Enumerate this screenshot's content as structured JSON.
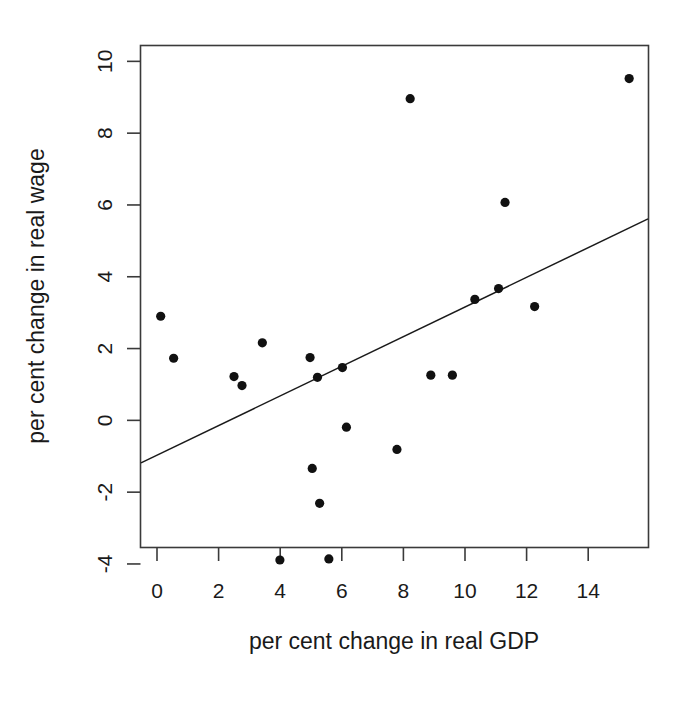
{
  "chart_data": {
    "type": "scatter",
    "title": "",
    "xlabel": "per cent change in real GDP",
    "ylabel": "per cent change in real wage",
    "xlim": [
      -0.75,
      16.3
    ],
    "ylim": [
      -4.6,
      10.4
    ],
    "xticks": [
      0,
      2,
      4,
      6,
      8,
      10,
      12,
      14
    ],
    "xtick_labels": [
      "0",
      "2",
      "4",
      "6",
      "8",
      "10",
      "12",
      "14"
    ],
    "yticks": [
      -4,
      -2,
      0,
      2,
      4,
      6,
      8,
      10
    ],
    "ytick_labels": [
      "-4",
      "-2",
      "0",
      "2",
      "4",
      "6",
      "8",
      "10"
    ],
    "grid": false,
    "legend": false,
    "legend_position": "none",
    "marker": "filled-circle",
    "marker_color": "#111111",
    "frame_color": "#3a3a3a",
    "x": [
      0.12,
      0.54,
      2.5,
      2.76,
      3.42,
      3.99,
      4.97,
      5.04,
      5.21,
      5.28,
      5.58,
      6.02,
      6.15,
      7.79,
      8.22,
      8.89,
      9.59,
      10.32,
      11.09,
      11.3,
      12.26,
      15.33
    ],
    "y": [
      2.9,
      1.73,
      1.22,
      0.97,
      2.16,
      -3.89,
      1.75,
      -1.34,
      1.2,
      -2.31,
      -3.86,
      1.47,
      -0.19,
      -0.81,
      8.96,
      1.26,
      1.26,
      3.37,
      3.67,
      6.07,
      3.17,
      9.52
    ],
    "points": [
      {
        "x": 0.12,
        "y": 2.9
      },
      {
        "x": 0.54,
        "y": 1.73
      },
      {
        "x": 2.5,
        "y": 1.22
      },
      {
        "x": 2.76,
        "y": 0.97
      },
      {
        "x": 3.42,
        "y": 2.16
      },
      {
        "x": 3.99,
        "y": -3.89
      },
      {
        "x": 4.97,
        "y": 1.75
      },
      {
        "x": 5.04,
        "y": -1.34
      },
      {
        "x": 5.21,
        "y": 1.2
      },
      {
        "x": 5.28,
        "y": -2.31
      },
      {
        "x": 5.58,
        "y": -3.86
      },
      {
        "x": 6.02,
        "y": 1.47
      },
      {
        "x": 6.15,
        "y": -0.19
      },
      {
        "x": 7.79,
        "y": -0.81
      },
      {
        "x": 8.22,
        "y": 8.96
      },
      {
        "x": 8.89,
        "y": 1.26
      },
      {
        "x": 9.59,
        "y": 1.26
      },
      {
        "x": 10.32,
        "y": 3.37
      },
      {
        "x": 11.09,
        "y": 3.67
      },
      {
        "x": 11.3,
        "y": 6.07
      },
      {
        "x": 12.26,
        "y": 3.17
      },
      {
        "x": 15.33,
        "y": 9.52
      }
    ],
    "fit_line": {
      "type": "linear-regression",
      "x_start": -0.75,
      "y_start": -1.28,
      "x_end": 16.3,
      "y_end": 5.76,
      "slope": 0.413,
      "intercept": -0.97
    }
  }
}
